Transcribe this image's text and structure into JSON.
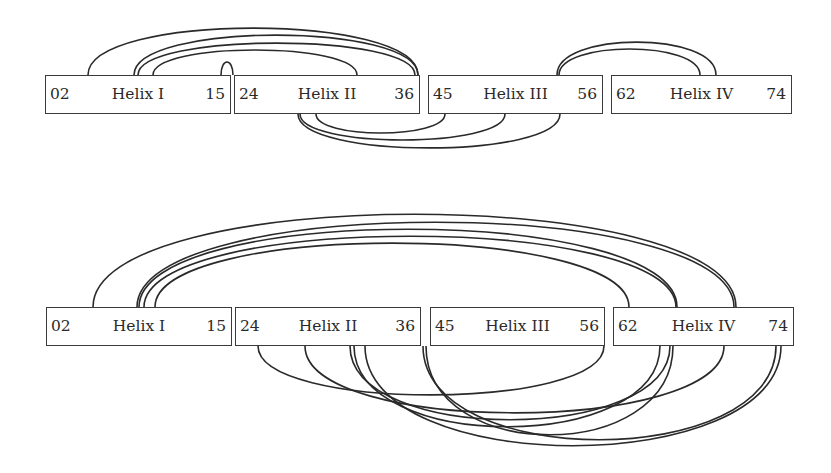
{
  "diagrams": [
    {
      "name": "top",
      "box_top": 75,
      "helices": [
        {
          "label": "Helix I",
          "start": "02",
          "end": "15",
          "x": 45,
          "w": 186
        },
        {
          "label": "Helix II",
          "start": "24",
          "end": "36",
          "x": 234,
          "w": 186
        },
        {
          "label": "Helix III",
          "start": "45",
          "end": "56",
          "x": 428,
          "w": 175
        },
        {
          "label": "Helix IV",
          "start": "62",
          "end": "74",
          "x": 611,
          "w": 181
        }
      ],
      "arcs_above": [
        {
          "x1": 88,
          "x2": 418,
          "peak": 28
        },
        {
          "x1": 134,
          "x2": 418,
          "peak": 35
        },
        {
          "x1": 138,
          "x2": 415,
          "peak": 43
        },
        {
          "x1": 153,
          "x2": 357,
          "peak": 50
        },
        {
          "x1": 221,
          "x2": 233,
          "peak": 62
        },
        {
          "x1": 557,
          "x2": 716,
          "peak": 42
        },
        {
          "x1": 559,
          "x2": 700,
          "peak": 49
        }
      ],
      "arcs_below": [
        {
          "x1": 316,
          "x2": 445,
          "depth": 133
        },
        {
          "x1": 300,
          "x2": 505,
          "depth": 140
        },
        {
          "x1": 298,
          "x2": 560,
          "depth": 148
        }
      ]
    },
    {
      "name": "bottom",
      "box_top": 307,
      "helices": [
        {
          "label": "Helix I",
          "start": "02",
          "end": "15",
          "x": 46,
          "w": 186
        },
        {
          "label": "Helix II",
          "start": "24",
          "end": "36",
          "x": 235,
          "w": 186
        },
        {
          "label": "Helix III",
          "start": "45",
          "end": "56",
          "x": 430,
          "w": 175
        },
        {
          "label": "Helix IV",
          "start": "62",
          "end": "74",
          "x": 613,
          "w": 181
        }
      ],
      "arcs_above": [
        {
          "x1": 93,
          "x2": 736,
          "peak": 214
        },
        {
          "x1": 137,
          "x2": 734,
          "peak": 222
        },
        {
          "x1": 139,
          "x2": 677,
          "peak": 229
        },
        {
          "x1": 144,
          "x2": 676,
          "peak": 236
        },
        {
          "x1": 155,
          "x2": 629,
          "peak": 243
        }
      ],
      "arcs_below": [
        {
          "x1": 258,
          "x2": 604,
          "depth": 395
        },
        {
          "x1": 305,
          "x2": 724,
          "depth": 413
        },
        {
          "x1": 350,
          "x2": 670,
          "depth": 420
        },
        {
          "x1": 354,
          "x2": 660,
          "depth": 427
        },
        {
          "x1": 365,
          "x2": 781,
          "depth": 446
        },
        {
          "x1": 423,
          "x2": 776,
          "depth": 440
        },
        {
          "x1": 426,
          "x2": 673,
          "depth": 435
        }
      ]
    }
  ]
}
